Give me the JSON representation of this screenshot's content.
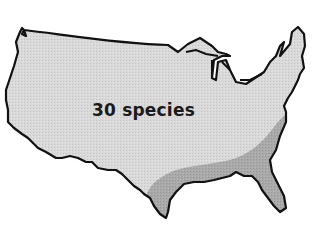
{
  "map": {
    "title": "",
    "region": "contiguous United States",
    "label": "30 species",
    "colors": {
      "background": "#ffffff",
      "outline": "#111111",
      "base_fill": "#d9d9d9",
      "highlight_fill": "#a9a9a9"
    },
    "regions": [
      {
        "name": "whole-range",
        "fill": "base_fill"
      },
      {
        "name": "southeast-range",
        "fill": "highlight_fill"
      }
    ]
  }
}
